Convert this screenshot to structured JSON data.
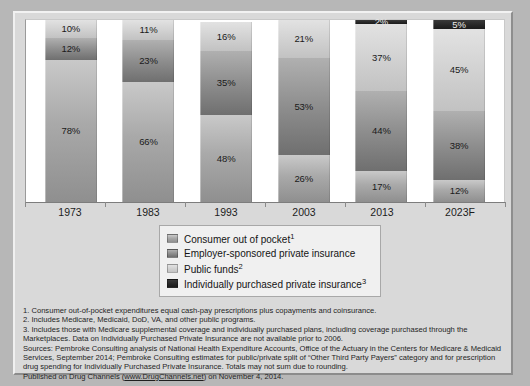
{
  "chart_data": {
    "type": "bar",
    "title": "",
    "subtitle": "",
    "xlabel": "",
    "ylabel": "",
    "ylim": [
      0,
      100
    ],
    "stacked": true,
    "grid": false,
    "legend_position": "bottom-center",
    "categories": [
      "1973",
      "1983",
      "1993",
      "2003",
      "2013",
      "2023F"
    ],
    "series": [
      {
        "name": "Consumer out of pocket",
        "key": "consumer",
        "color": "#a9a9a9",
        "values": [
          78,
          66,
          48,
          26,
          17,
          12
        ]
      },
      {
        "name": "Employer-sponsored private insurance",
        "key": "employer",
        "color": "#8e8e8e",
        "values": [
          12,
          23,
          35,
          53,
          44,
          38
        ]
      },
      {
        "name": "Public funds",
        "key": "public",
        "color": "#d2d2d2",
        "values": [
          10,
          11,
          16,
          21,
          37,
          45
        ]
      },
      {
        "name": "Individually purchased private insurance",
        "key": "individual",
        "color": "#262626",
        "values": [
          0,
          0,
          0,
          0,
          2,
          5
        ]
      }
    ],
    "data_labels": {
      "1973": {
        "consumer": "78%",
        "employer": "12%",
        "public": "10%",
        "individual": ""
      },
      "1983": {
        "consumer": "66%",
        "employer": "23%",
        "public": "11%",
        "individual": ""
      },
      "1993": {
        "consumer": "48%",
        "employer": "35%",
        "public": "16%",
        "individual": ""
      },
      "2003": {
        "consumer": "26%",
        "employer": "53%",
        "public": "21%",
        "individual": ""
      },
      "2013": {
        "consumer": "17%",
        "employer": "44%",
        "public": "37%",
        "individual": "2%"
      },
      "2023F": {
        "consumer": "12%",
        "employer": "38%",
        "public": "45%",
        "individual": "5%"
      }
    }
  },
  "xaxis": {
    "labels": [
      "1973",
      "1983",
      "1993",
      "2003",
      "2013",
      "2023F"
    ]
  },
  "bars": [
    {
      "category": "1973",
      "segments": [
        {
          "name": "Public funds",
          "label": "10%",
          "value": 10,
          "style": "fill-pub",
          "tone": "light"
        },
        {
          "name": "Employer-sponsored private insurance",
          "label": "12%",
          "value": 12,
          "style": "fill-emp",
          "tone": "light"
        },
        {
          "name": "Consumer out of pocket",
          "label": "78%",
          "value": 78,
          "style": "fill-cop",
          "tone": "light"
        }
      ]
    },
    {
      "category": "1983",
      "segments": [
        {
          "name": "Public funds",
          "label": "11%",
          "value": 11,
          "style": "fill-pub",
          "tone": "light"
        },
        {
          "name": "Employer-sponsored private insurance",
          "label": "23%",
          "value": 23,
          "style": "fill-emp",
          "tone": "light"
        },
        {
          "name": "Consumer out of pocket",
          "label": "66%",
          "value": 66,
          "style": "fill-cop",
          "tone": "light"
        }
      ]
    },
    {
      "category": "1993",
      "segments": [
        {
          "name": "Public funds",
          "label": "16%",
          "value": 16,
          "style": "fill-pub",
          "tone": "light"
        },
        {
          "name": "Employer-sponsored private insurance",
          "label": "35%",
          "value": 35,
          "style": "fill-emp",
          "tone": "light"
        },
        {
          "name": "Consumer out of pocket",
          "label": "48%",
          "value": 48,
          "style": "fill-cop",
          "tone": "light"
        }
      ]
    },
    {
      "category": "2003",
      "segments": [
        {
          "name": "Public funds",
          "label": "21%",
          "value": 21,
          "style": "fill-pub",
          "tone": "light"
        },
        {
          "name": "Employer-sponsored private insurance",
          "label": "53%",
          "value": 53,
          "style": "fill-emp",
          "tone": "light"
        },
        {
          "name": "Consumer out of pocket",
          "label": "26%",
          "value": 26,
          "style": "fill-cop",
          "tone": "light"
        }
      ]
    },
    {
      "category": "2013",
      "segments": [
        {
          "name": "Individually purchased private insurance",
          "label": "2%",
          "value": 2,
          "style": "fill-ind",
          "tone": "verydark"
        },
        {
          "name": "Public funds",
          "label": "37%",
          "value": 37,
          "style": "fill-pub",
          "tone": "light"
        },
        {
          "name": "Employer-sponsored private insurance",
          "label": "44%",
          "value": 44,
          "style": "fill-emp",
          "tone": "light"
        },
        {
          "name": "Consumer out of pocket",
          "label": "17%",
          "value": 17,
          "style": "fill-cop",
          "tone": "light"
        }
      ]
    },
    {
      "category": "2023F",
      "segments": [
        {
          "name": "Individually purchased private insurance",
          "label": "5%",
          "value": 5,
          "style": "fill-ind",
          "tone": "verydark"
        },
        {
          "name": "Public funds",
          "label": "45%",
          "value": 45,
          "style": "fill-pub",
          "tone": "light"
        },
        {
          "name": "Employer-sponsored private insurance",
          "label": "38%",
          "value": 38,
          "style": "fill-emp",
          "tone": "light"
        },
        {
          "name": "Consumer out of pocket",
          "label": "12%",
          "value": 12,
          "style": "fill-cop",
          "tone": "light"
        }
      ]
    }
  ],
  "legend": {
    "items": [
      {
        "label": "Consumer out of pocket",
        "sup": "1",
        "style": "fill-cop"
      },
      {
        "label": "Employer-sponsored private insurance",
        "sup": "",
        "style": "fill-emp"
      },
      {
        "label": "Public funds",
        "sup": "2",
        "style": "fill-pub"
      },
      {
        "label": "Individually purchased private insurance",
        "sup": "3",
        "style": "fill-ind"
      }
    ]
  },
  "notes": {
    "line1": "1. Consumer out-of-pocket expenditures equal cash-pay prescriptions plus copayments and coinsurance.",
    "line2": "2. Includes Medicare, Medicaid, DoD, VA, and other public programs.",
    "line3a": "3. Includes those with Medicare supplemental coverage and individually purchased plans, including coverage purchased through the",
    "line3b": "Marketplaces. Data on Individually Purchased Private Insurance are not available prior to 2006.",
    "line4a": "Sources: Pembroke Consulting analysis of National Health Expenditure Accounts, Office of the Actuary in the Centers for Medicare & Medicaid",
    "line4b": "Services, September 2014; Pembroke Consulting estimates for public/private split of “Other Third Party Payers” category and for prescription",
    "line4c": "drug spending for Individually Purchased Private Insurance. Totals may not sum due to rounding.",
    "published_prefix": "Published on Drug Channels (",
    "published_link": "www.DrugChannels.net",
    "published_suffix": ") on November 4, 2014."
  }
}
